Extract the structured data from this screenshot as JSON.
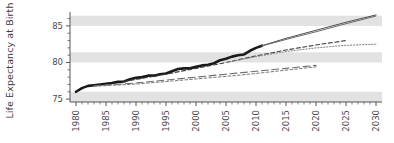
{
  "chart_data": {
    "type": "line",
    "title": "",
    "xlabel": "",
    "ylabel": "Life Expectancy at Birth",
    "xlim": [
      1979,
      2031
    ],
    "ylim": [
      74.6,
      86.9
    ],
    "grid": "horizontal-banded",
    "legend": "none",
    "xticks": [
      1980,
      1985,
      1990,
      1995,
      2000,
      2005,
      2010,
      2015,
      2020,
      2025,
      2030
    ],
    "xtick_labels": [
      "1980",
      "1985",
      "1990",
      "1995",
      "2000",
      "2005",
      "2010",
      "2015",
      "2020",
      "2025",
      "2030"
    ],
    "yticks": [
      75,
      80,
      85
    ],
    "ytick_labels": [
      "75",
      "80",
      "85"
    ],
    "yticks_minor": [
      76,
      77,
      78,
      79,
      81,
      82,
      83,
      84,
      86
    ],
    "bands": [
      {
        "from": 74.6,
        "to": 76.0
      },
      {
        "from": 80.0,
        "to": 81.4
      },
      {
        "from": 85.0,
        "to": 86.4
      }
    ],
    "band_color": "#e2e2e2",
    "axis_color": "#555555",
    "series": [
      {
        "name": "Observed life expectancy",
        "style": "solid-thick",
        "color": "#1a1a1a",
        "width": 2.6,
        "x": [
          1980,
          1981,
          1982,
          1983,
          1984,
          1985,
          1986,
          1987,
          1988,
          1989,
          1990,
          1991,
          1992,
          1993,
          1994,
          1995,
          1996,
          1997,
          1998,
          1999,
          2000,
          2001,
          2002,
          2003,
          2004,
          2005,
          2006,
          2007,
          2008,
          2009,
          2010,
          2011
        ],
        "values": [
          76.0,
          76.5,
          76.8,
          76.9,
          77.0,
          77.1,
          77.2,
          77.35,
          77.4,
          77.7,
          77.9,
          78.0,
          78.2,
          78.2,
          78.4,
          78.5,
          78.8,
          79.1,
          79.2,
          79.2,
          79.4,
          79.6,
          79.7,
          79.9,
          80.3,
          80.5,
          80.8,
          81.0,
          81.1,
          81.6,
          82.0,
          82.3
        ]
      },
      {
        "name": "Projection A upper",
        "style": "solid-thin",
        "color": "#4f4f4f",
        "width": 1.0,
        "x": [
          2011,
          2015,
          2020,
          2025,
          2030
        ],
        "values": [
          82.3,
          83.3,
          84.4,
          85.5,
          86.5
        ]
      },
      {
        "name": "Projection A lower",
        "style": "solid-thin",
        "color": "#6a6a6a",
        "width": 1.0,
        "x": [
          2011,
          2015,
          2020,
          2025,
          2030
        ],
        "values": [
          82.25,
          83.15,
          84.2,
          85.3,
          86.35
        ]
      },
      {
        "name": "Projection B dashed",
        "style": "dashed",
        "color": "#3d3d3d",
        "width": 1.1,
        "x": [
          1988,
          1995,
          2000,
          2005,
          2010,
          2015,
          2020,
          2025
        ],
        "values": [
          77.4,
          78.4,
          79.2,
          80.0,
          80.9,
          81.7,
          82.4,
          83.0
        ]
      },
      {
        "name": "Projection C dotted",
        "style": "dotted",
        "color": "#8a8a8a",
        "width": 1.1,
        "x": [
          2005,
          2010,
          2015,
          2020,
          2025,
          2030
        ],
        "values": [
          80.0,
          80.8,
          81.5,
          82.0,
          82.35,
          82.5
        ]
      },
      {
        "name": "Projection D long-dash",
        "style": "long-dash",
        "color": "#6d6d6d",
        "width": 1.1,
        "x": [
          1983,
          1990,
          1995,
          2000,
          2005,
          2010,
          2015,
          2020
        ],
        "values": [
          76.8,
          77.2,
          77.6,
          78.0,
          78.4,
          78.8,
          79.2,
          79.6
        ]
      },
      {
        "name": "Projection E short-dash",
        "style": "short-dash",
        "color": "#7a7a7a",
        "width": 1.0,
        "x": [
          1983,
          1990,
          1995,
          2000,
          2005,
          2010,
          2015,
          2020
        ],
        "values": [
          76.75,
          77.05,
          77.4,
          77.75,
          78.1,
          78.5,
          78.95,
          79.4
        ]
      }
    ]
  }
}
